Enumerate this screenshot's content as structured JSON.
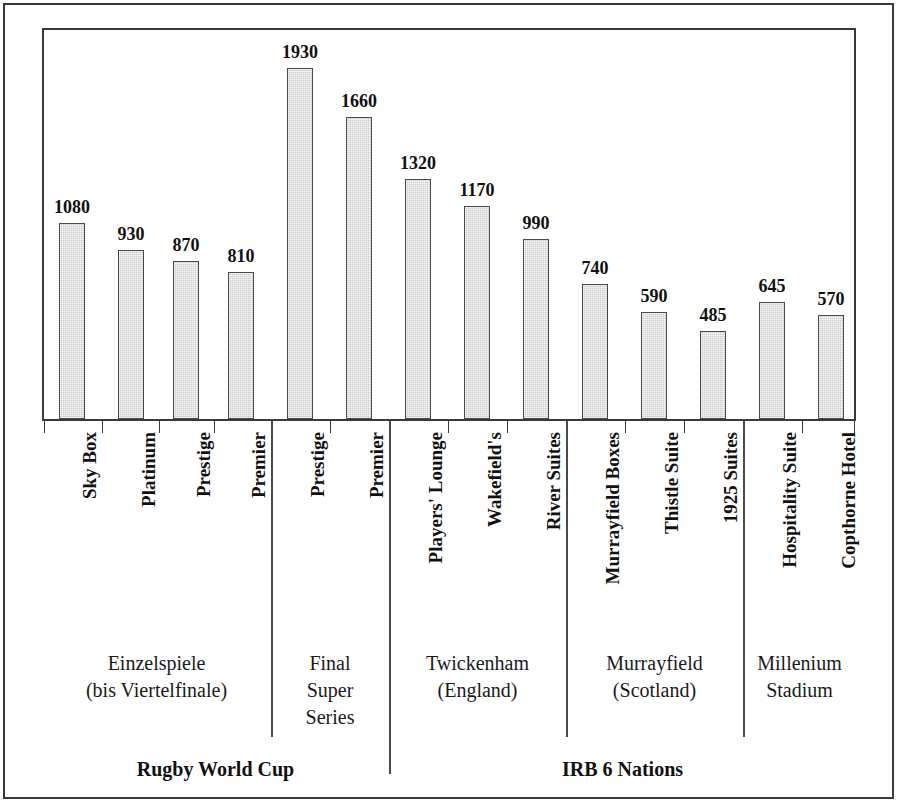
{
  "chart_data": {
    "type": "bar",
    "title": "",
    "subtitle": "",
    "xlabel": "",
    "ylabel": "",
    "ylim": [
      0,
      2150
    ],
    "grid": false,
    "legend": null,
    "value_labels_shown": true,
    "categories": [
      "Sky Box",
      "Platinum",
      "Prestige",
      "Premier",
      "Prestige",
      "Premier",
      "Players' Lounge",
      "Wakefield's",
      "River Suites",
      "Murrayfield Boxes",
      "Thistle Suite",
      "1925 Suites",
      "Hospitality Suite",
      "Copthorne Hotel"
    ],
    "values": [
      1080,
      930,
      870,
      810,
      1930,
      1660,
      1320,
      1170,
      990,
      740,
      590,
      485,
      645,
      570
    ],
    "groups": [
      {
        "label": "Einzelspiele\n(bis Viertelfinale)",
        "start": 0,
        "end": 3
      },
      {
        "label": "Final\nSuper\nSeries",
        "start": 4,
        "end": 5
      },
      {
        "label": "Twickenham\n(England)",
        "start": 6,
        "end": 8
      },
      {
        "label": "Murrayfield\n(Scotland)",
        "start": 9,
        "end": 11
      },
      {
        "label": "Millenium\nStadium",
        "start": 12,
        "end": 13
      }
    ],
    "supergroups": [
      {
        "label": "Rugby World Cup",
        "start": 0,
        "end": 5
      },
      {
        "label": "IRB 6 Nations",
        "start": 6,
        "end": 13
      }
    ],
    "bar_fill_color": "#cdcdcd",
    "bar_border_color": "#4a4a4a",
    "axis_color": "#3a3a3a",
    "text_color": "#111111"
  },
  "figure": {
    "frame_color": "#3a3a3a",
    "background": "#ffffff"
  }
}
